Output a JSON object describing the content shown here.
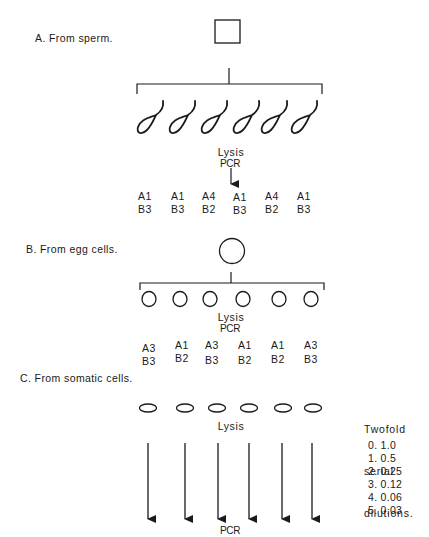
{
  "panel_a": {
    "title": "A. From sperm.",
    "parent_symbol": "square",
    "offspring_symbol": "sperm",
    "offspring_count": 6,
    "lysis_label": "Lysis",
    "pcr_label": "PCR",
    "genotypes": [
      {
        "a": "A1",
        "b": "B3"
      },
      {
        "a": "A1",
        "b": "B3"
      },
      {
        "a": "A4",
        "b": "B2"
      },
      {
        "a": "A1",
        "b": "B3"
      },
      {
        "a": "A4",
        "b": "B2"
      },
      {
        "a": "A1",
        "b": "B3"
      }
    ]
  },
  "panel_b": {
    "title": "B. From egg cells.",
    "parent_symbol": "circle",
    "offspring_symbol": "egg-cell",
    "offspring_count": 6,
    "lysis_label": "Lysis",
    "pcr_label": "PCR",
    "genotypes": [
      {
        "a": "A3",
        "b": "B3"
      },
      {
        "a": "A1",
        "b": "B2"
      },
      {
        "a": "A3",
        "b": "B3"
      },
      {
        "a": "A1",
        "b": "B2"
      },
      {
        "a": "A1",
        "b": "B2"
      },
      {
        "a": "A3",
        "b": "B3"
      }
    ]
  },
  "panel_c": {
    "title": "C. From somatic cells.",
    "offspring_symbol": "somatic-cell",
    "offspring_count": 6,
    "lysis_label": "Lysis",
    "pcr_label": "PCR",
    "dilutions": {
      "title_lines": [
        "Twofold",
        "serial",
        "dilutions."
      ],
      "items": [
        {
          "index": "0.",
          "value": "1.0"
        },
        {
          "index": "1.",
          "value": "0.5"
        },
        {
          "index": "2.",
          "value": "0.25"
        },
        {
          "index": "3.",
          "value": "0.12"
        },
        {
          "index": "4.",
          "value": "0.06"
        },
        {
          "index": "5.",
          "value": "0.03"
        }
      ]
    }
  }
}
